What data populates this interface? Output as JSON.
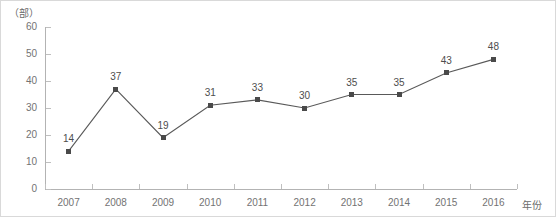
{
  "chart_data": {
    "type": "line",
    "title": "",
    "subtitle": "",
    "xlabel": "年份",
    "ylabel": "",
    "unit_label": "（部）",
    "categories": [
      "2007",
      "2008",
      "2009",
      "2010",
      "2011",
      "2012",
      "2013",
      "2014",
      "2015",
      "2016"
    ],
    "values": [
      14,
      37,
      19,
      31,
      33,
      30,
      35,
      35,
      43,
      48
    ],
    "data_labels": [
      "14",
      "37",
      "19",
      "31",
      "33",
      "30",
      "35",
      "35",
      "43",
      "48"
    ],
    "ylim": [
      0,
      60
    ],
    "yticks": [
      0,
      10,
      20,
      30,
      40,
      50,
      60
    ],
    "ytick_labels": [
      "0",
      "10",
      "20",
      "30",
      "40",
      "50",
      "60"
    ],
    "grid": false,
    "legend": "none",
    "series": [
      {
        "name": "",
        "values": [
          14,
          37,
          19,
          31,
          33,
          30,
          35,
          35,
          43,
          48
        ],
        "marker": "square",
        "line_color": "#595959",
        "marker_color": "#4a4a4a"
      }
    ],
    "colors": {
      "line": "#595959",
      "marker": "#4a4a4a",
      "axis": "#b3b3b3",
      "tick_text": "#737373",
      "label_text": "#4d4d4d",
      "border": "#d9d9d9",
      "background": "#ffffff"
    }
  }
}
